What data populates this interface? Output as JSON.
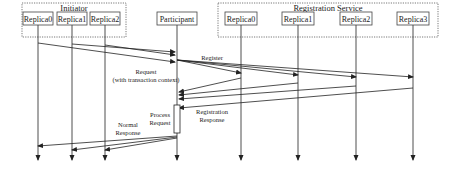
{
  "diagram": {
    "type": "sequence",
    "groups": [
      {
        "id": "initiator",
        "label": "Initiator",
        "x": 22,
        "y": 3,
        "w": 104,
        "h": 34
      },
      {
        "id": "registration",
        "label": "Registration Service",
        "x": 218,
        "y": 3,
        "w": 220,
        "h": 34
      }
    ],
    "participants": [
      {
        "id": "i0",
        "label": "Replica0",
        "x": 38,
        "box_w": 30
      },
      {
        "id": "i1",
        "label": "Replica1",
        "x": 72,
        "box_w": 30
      },
      {
        "id": "i2",
        "label": "Replica2",
        "x": 105,
        "box_w": 30
      },
      {
        "id": "p",
        "label": "Participant",
        "x": 177,
        "box_w": 40
      },
      {
        "id": "r0",
        "label": "Replica0",
        "x": 241,
        "box_w": 32
      },
      {
        "id": "r1",
        "label": "Replica1",
        "x": 298,
        "box_w": 32
      },
      {
        "id": "r2",
        "label": "Replica2",
        "x": 356,
        "box_w": 32
      },
      {
        "id": "r3",
        "label": "Replica3",
        "x": 413,
        "box_w": 32
      }
    ],
    "messages": [
      {
        "from": "i0",
        "to": "p",
        "y1": 43,
        "y2": 62
      },
      {
        "from": "i1",
        "to": "p",
        "y1": 44,
        "y2": 52
      },
      {
        "from": "i2",
        "to": "p",
        "y1": 45,
        "y2": 55
      },
      {
        "from": "p",
        "to": "r0",
        "y1": 60,
        "y2": 73
      },
      {
        "from": "p",
        "to": "r1",
        "y1": 60,
        "y2": 75
      },
      {
        "from": "p",
        "to": "r2",
        "y1": 60,
        "y2": 77
      },
      {
        "from": "p",
        "to": "r3",
        "y1": 60,
        "y2": 77
      },
      {
        "from": "r0",
        "to": "p",
        "y1": 78,
        "y2": 92
      },
      {
        "from": "r1",
        "to": "p",
        "y1": 83,
        "y2": 95
      },
      {
        "from": "r2",
        "to": "p",
        "y1": 86,
        "y2": 99
      },
      {
        "from": "r3",
        "to": "p",
        "y1": 88,
        "y2": 108
      },
      {
        "from": "p",
        "to": "i0",
        "y1": 136,
        "y2": 146
      },
      {
        "from": "p",
        "to": "i1",
        "y1": 137,
        "y2": 150
      },
      {
        "from": "p",
        "to": "i2",
        "y1": 138,
        "y2": 150
      }
    ],
    "labels": {
      "request_line1": "Request",
      "request_line2": "(with transaction context)",
      "register": "Register",
      "process_line1": "Process",
      "process_line2": "Request",
      "registration_response_line1": "Registration",
      "registration_response_line2": "Response",
      "normal_response_line1": "Normal",
      "normal_response_line2": "Response"
    },
    "activation": {
      "x": 174,
      "y": 105,
      "w": 6,
      "h": 28
    },
    "lifeline_top": 18,
    "lifeline_bottom": 160
  }
}
